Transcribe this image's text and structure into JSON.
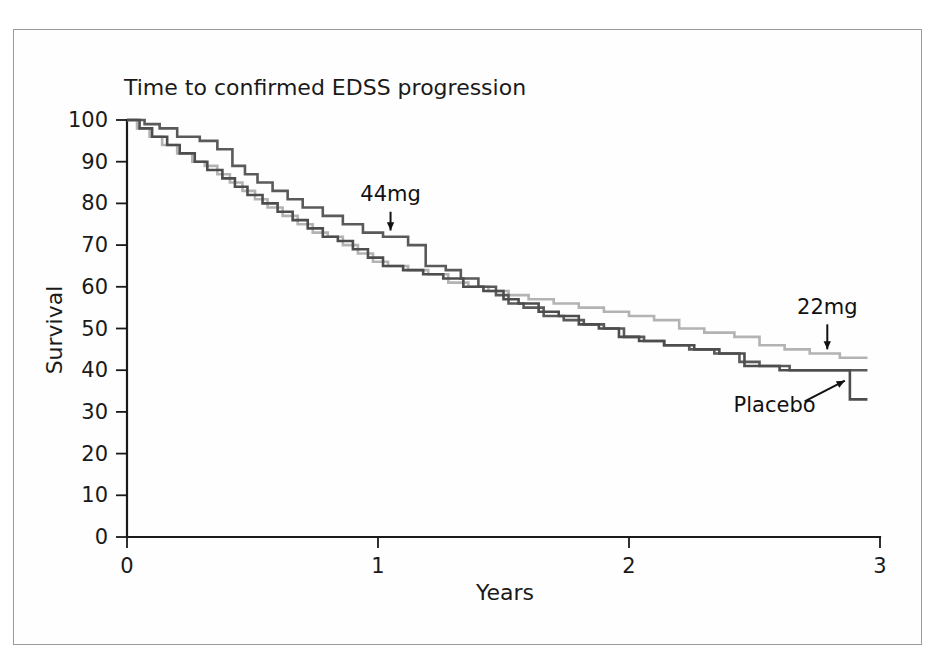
{
  "figure": {
    "border_color": "#9a9a9a",
    "background": "#ffffff"
  },
  "chart_data": {
    "type": "line",
    "subtype": "kaplan-meier-step",
    "title": "Time to confirmed EDSS progression",
    "xlabel": "Years",
    "ylabel": "Survival",
    "xlim": [
      0,
      3
    ],
    "ylim": [
      0,
      100
    ],
    "xticks": [
      "0",
      "1",
      "2",
      "3"
    ],
    "xtick_values": [
      0,
      1,
      2,
      3
    ],
    "yticks": [
      "0",
      "10",
      "20",
      "30",
      "40",
      "50",
      "60",
      "70",
      "80",
      "90",
      "100"
    ],
    "ytick_values": [
      0,
      10,
      20,
      30,
      40,
      50,
      60,
      70,
      80,
      90,
      100
    ],
    "grid": false,
    "legend": "annotations-inline",
    "annotations": [
      {
        "label": "44mg",
        "label_x": 1.05,
        "label_y": 80.5,
        "arrow_from_x": 1.05,
        "arrow_from_y": 78.0,
        "arrow_to_x": 1.05,
        "arrow_to_y": 73.5,
        "style": "down-arrow"
      },
      {
        "label": "22mg",
        "label_x": 2.79,
        "label_y": 53.5,
        "arrow_from_x": 2.79,
        "arrow_from_y": 51.0,
        "arrow_to_x": 2.79,
        "arrow_to_y": 45.0,
        "style": "down-arrow"
      },
      {
        "label": "Placebo",
        "label_x": 2.58,
        "label_y": 30.0,
        "arrow_from_x": 2.7,
        "arrow_from_y": 32.5,
        "arrow_to_x": 2.86,
        "arrow_to_y": 37.5,
        "style": "diagonal-arrow"
      }
    ],
    "series": [
      {
        "name": "44mg",
        "color": "#5a5a5a",
        "points": [
          [
            0.0,
            100
          ],
          [
            0.07,
            100
          ],
          [
            0.07,
            99
          ],
          [
            0.13,
            99
          ],
          [
            0.13,
            98
          ],
          [
            0.2,
            98
          ],
          [
            0.2,
            96
          ],
          [
            0.29,
            96
          ],
          [
            0.29,
            95
          ],
          [
            0.36,
            95
          ],
          [
            0.36,
            93
          ],
          [
            0.42,
            93
          ],
          [
            0.42,
            89
          ],
          [
            0.47,
            89
          ],
          [
            0.47,
            87
          ],
          [
            0.52,
            87
          ],
          [
            0.52,
            85
          ],
          [
            0.58,
            85
          ],
          [
            0.58,
            83
          ],
          [
            0.64,
            83
          ],
          [
            0.64,
            81
          ],
          [
            0.7,
            81
          ],
          [
            0.7,
            79
          ],
          [
            0.78,
            79
          ],
          [
            0.78,
            77
          ],
          [
            0.86,
            77
          ],
          [
            0.86,
            75
          ],
          [
            0.94,
            75
          ],
          [
            0.94,
            73
          ],
          [
            1.02,
            73
          ],
          [
            1.02,
            72
          ],
          [
            1.12,
            72
          ],
          [
            1.12,
            70
          ],
          [
            1.19,
            70
          ],
          [
            1.19,
            65
          ],
          [
            1.27,
            65
          ],
          [
            1.27,
            64
          ],
          [
            1.33,
            64
          ],
          [
            1.33,
            62
          ],
          [
            1.4,
            62
          ],
          [
            1.4,
            60
          ],
          [
            1.47,
            60
          ],
          [
            1.47,
            58
          ],
          [
            1.52,
            58
          ],
          [
            1.52,
            56
          ],
          [
            1.58,
            56
          ],
          [
            1.58,
            55
          ],
          [
            1.66,
            55
          ],
          [
            1.66,
            53
          ],
          [
            1.74,
            53
          ],
          [
            1.74,
            52
          ],
          [
            1.82,
            52
          ],
          [
            1.82,
            51
          ],
          [
            1.9,
            51
          ],
          [
            1.9,
            50
          ],
          [
            1.98,
            50
          ],
          [
            1.98,
            48
          ],
          [
            2.06,
            48
          ],
          [
            2.06,
            47
          ],
          [
            2.14,
            47
          ],
          [
            2.14,
            46
          ],
          [
            2.24,
            46
          ],
          [
            2.24,
            45
          ],
          [
            2.34,
            45
          ],
          [
            2.34,
            44
          ],
          [
            2.44,
            44
          ],
          [
            2.44,
            42
          ],
          [
            2.52,
            42
          ],
          [
            2.52,
            41
          ],
          [
            2.64,
            41
          ],
          [
            2.64,
            40
          ],
          [
            2.8,
            40
          ],
          [
            2.8,
            40
          ],
          [
            2.95,
            40
          ]
        ]
      },
      {
        "name": "22mg",
        "color": "#b3b3b3",
        "points": [
          [
            0.0,
            100
          ],
          [
            0.04,
            100
          ],
          [
            0.04,
            98
          ],
          [
            0.09,
            98
          ],
          [
            0.09,
            96
          ],
          [
            0.14,
            96
          ],
          [
            0.14,
            94
          ],
          [
            0.2,
            94
          ],
          [
            0.2,
            92
          ],
          [
            0.26,
            92
          ],
          [
            0.26,
            90
          ],
          [
            0.31,
            90
          ],
          [
            0.31,
            89
          ],
          [
            0.36,
            89
          ],
          [
            0.36,
            87
          ],
          [
            0.41,
            87
          ],
          [
            0.41,
            85
          ],
          [
            0.46,
            85
          ],
          [
            0.46,
            83
          ],
          [
            0.51,
            83
          ],
          [
            0.51,
            81
          ],
          [
            0.56,
            81
          ],
          [
            0.56,
            79
          ],
          [
            0.62,
            79
          ],
          [
            0.62,
            77
          ],
          [
            0.68,
            77
          ],
          [
            0.68,
            75
          ],
          [
            0.74,
            75
          ],
          [
            0.74,
            73
          ],
          [
            0.8,
            73
          ],
          [
            0.8,
            72
          ],
          [
            0.86,
            72
          ],
          [
            0.86,
            70
          ],
          [
            0.92,
            70
          ],
          [
            0.92,
            68
          ],
          [
            0.98,
            68
          ],
          [
            0.98,
            66
          ],
          [
            1.04,
            66
          ],
          [
            1.04,
            65
          ],
          [
            1.12,
            65
          ],
          [
            1.12,
            64
          ],
          [
            1.2,
            64
          ],
          [
            1.2,
            63
          ],
          [
            1.28,
            63
          ],
          [
            1.28,
            61
          ],
          [
            1.36,
            61
          ],
          [
            1.36,
            60
          ],
          [
            1.44,
            60
          ],
          [
            1.44,
            59
          ],
          [
            1.52,
            59
          ],
          [
            1.52,
            58
          ],
          [
            1.6,
            58
          ],
          [
            1.6,
            57
          ],
          [
            1.7,
            57
          ],
          [
            1.7,
            56
          ],
          [
            1.8,
            56
          ],
          [
            1.8,
            55
          ],
          [
            1.9,
            55
          ],
          [
            1.9,
            54
          ],
          [
            2.0,
            54
          ],
          [
            2.0,
            53
          ],
          [
            2.1,
            53
          ],
          [
            2.1,
            52
          ],
          [
            2.2,
            52
          ],
          [
            2.2,
            50
          ],
          [
            2.3,
            50
          ],
          [
            2.3,
            49
          ],
          [
            2.42,
            49
          ],
          [
            2.42,
            48
          ],
          [
            2.52,
            48
          ],
          [
            2.52,
            46
          ],
          [
            2.62,
            46
          ],
          [
            2.62,
            45
          ],
          [
            2.72,
            45
          ],
          [
            2.72,
            44
          ],
          [
            2.84,
            44
          ],
          [
            2.84,
            43
          ],
          [
            2.95,
            43
          ]
        ]
      },
      {
        "name": "Placebo",
        "color": "#4d4d4d",
        "points": [
          [
            0.0,
            100
          ],
          [
            0.05,
            100
          ],
          [
            0.05,
            98
          ],
          [
            0.1,
            98
          ],
          [
            0.1,
            96
          ],
          [
            0.16,
            96
          ],
          [
            0.16,
            94
          ],
          [
            0.21,
            94
          ],
          [
            0.21,
            92
          ],
          [
            0.27,
            92
          ],
          [
            0.27,
            90
          ],
          [
            0.32,
            90
          ],
          [
            0.32,
            88
          ],
          [
            0.38,
            88
          ],
          [
            0.38,
            86
          ],
          [
            0.43,
            86
          ],
          [
            0.43,
            84
          ],
          [
            0.48,
            84
          ],
          [
            0.48,
            82
          ],
          [
            0.54,
            82
          ],
          [
            0.54,
            80
          ],
          [
            0.6,
            80
          ],
          [
            0.6,
            78
          ],
          [
            0.66,
            78
          ],
          [
            0.66,
            76
          ],
          [
            0.72,
            76
          ],
          [
            0.72,
            74
          ],
          [
            0.78,
            74
          ],
          [
            0.78,
            72
          ],
          [
            0.84,
            72
          ],
          [
            0.84,
            71
          ],
          [
            0.9,
            71
          ],
          [
            0.9,
            69
          ],
          [
            0.96,
            69
          ],
          [
            0.96,
            67
          ],
          [
            1.02,
            67
          ],
          [
            1.02,
            65
          ],
          [
            1.1,
            65
          ],
          [
            1.1,
            64
          ],
          [
            1.18,
            64
          ],
          [
            1.18,
            63
          ],
          [
            1.26,
            63
          ],
          [
            1.26,
            62
          ],
          [
            1.34,
            62
          ],
          [
            1.34,
            60
          ],
          [
            1.42,
            60
          ],
          [
            1.42,
            59
          ],
          [
            1.5,
            59
          ],
          [
            1.5,
            57
          ],
          [
            1.56,
            57
          ],
          [
            1.56,
            56
          ],
          [
            1.64,
            56
          ],
          [
            1.64,
            54
          ],
          [
            1.72,
            54
          ],
          [
            1.72,
            53
          ],
          [
            1.8,
            53
          ],
          [
            1.8,
            51
          ],
          [
            1.88,
            51
          ],
          [
            1.88,
            50
          ],
          [
            1.96,
            50
          ],
          [
            1.96,
            48
          ],
          [
            2.04,
            48
          ],
          [
            2.04,
            47
          ],
          [
            2.14,
            47
          ],
          [
            2.14,
            46
          ],
          [
            2.26,
            46
          ],
          [
            2.26,
            45
          ],
          [
            2.36,
            45
          ],
          [
            2.36,
            44
          ],
          [
            2.46,
            44
          ],
          [
            2.46,
            41
          ],
          [
            2.6,
            41
          ],
          [
            2.6,
            40
          ],
          [
            2.78,
            40
          ],
          [
            2.78,
            40
          ],
          [
            2.88,
            40
          ],
          [
            2.88,
            33
          ],
          [
            2.95,
            33
          ]
        ]
      }
    ]
  }
}
